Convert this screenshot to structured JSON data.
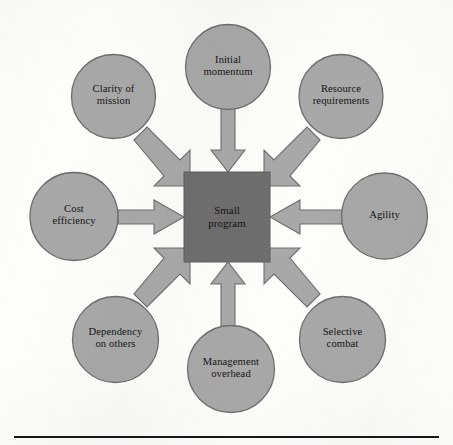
{
  "figure": {
    "type": "hub-and-spoke",
    "center": {
      "label": "Small program",
      "label_line1": "Small",
      "label_line2": "program",
      "shape": "square",
      "fill": "#6e6e6e"
    },
    "node_fill": "#a8a8a8",
    "node_stroke": "#6e6e6e",
    "arrow_fill": "#a8a8a8",
    "arrow_stroke": "#6e6e6e",
    "background": "#fdfdfc",
    "rule_color": "#17171a",
    "nodes": [
      {
        "id": "clarity-of-mission",
        "label": "Clarity of mission",
        "line1": "Clarity of",
        "line2": "mission",
        "position": "top-left",
        "arrow_direction": "toward-center-diagonal"
      },
      {
        "id": "initial-momentum",
        "label": "Initial momentum",
        "line1": "Initial",
        "line2": "momentum",
        "position": "top",
        "arrow_direction": "down"
      },
      {
        "id": "resource-requirements",
        "label": "Resource requirements",
        "line1": "Resource",
        "line2": "requirements",
        "position": "top-right",
        "arrow_direction": "toward-center-diagonal"
      },
      {
        "id": "cost-efficiency",
        "label": "Cost efficiency",
        "line1": "Cost",
        "line2": "efficiency",
        "position": "left",
        "arrow_direction": "right"
      },
      {
        "id": "agility",
        "label": "Agility",
        "line1": "Agility",
        "line2": "",
        "position": "right",
        "arrow_direction": "left"
      },
      {
        "id": "dependency-on-others",
        "label": "Dependency on others",
        "line1": "Dependency",
        "line2": "on others",
        "position": "bottom-left",
        "arrow_direction": "toward-center-diagonal"
      },
      {
        "id": "management-overhead",
        "label": "Management overhead",
        "line1": "Management",
        "line2": "overhead",
        "position": "bottom",
        "arrow_direction": "up"
      },
      {
        "id": "selective-combat",
        "label": "Selective combat",
        "line1": "Selective",
        "line2": "combat",
        "position": "bottom-right",
        "arrow_direction": "toward-center-diagonal"
      }
    ]
  }
}
